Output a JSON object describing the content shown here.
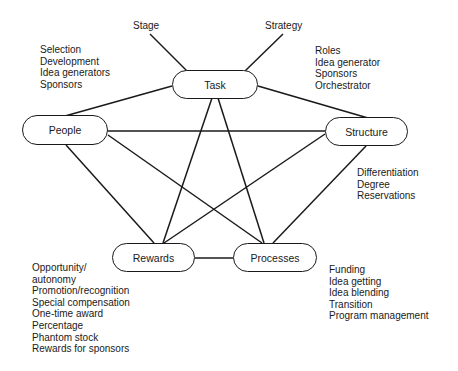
{
  "diagram": {
    "nodes": {
      "task": "Task",
      "people": "People",
      "structure": "Structure",
      "rewards": "Rewards",
      "processes": "Processes"
    },
    "external_labels": {
      "stage": "Stage",
      "strategy": "Strategy"
    },
    "lists": {
      "people": [
        "Selection",
        "Development",
        "Idea generators",
        "Sponsors"
      ],
      "structure_roles": [
        "Roles",
        "Idea generator",
        "Sponsors",
        "Orchestrator"
      ],
      "structure": [
        "Differentiation",
        "Degree",
        "Reservations"
      ],
      "rewards": [
        "Opportunity/",
        "autonomy",
        "Promotion/recognition",
        "Special compensation",
        "One-time award",
        "Percentage",
        "Phantom stock",
        "Rewards for sponsors"
      ],
      "processes": [
        "Funding",
        "Idea getting",
        "Idea blending",
        "Transition",
        "Program management"
      ]
    },
    "edges": [
      [
        "stage",
        "task"
      ],
      [
        "strategy",
        "task"
      ],
      [
        "task",
        "people"
      ],
      [
        "task",
        "structure"
      ],
      [
        "task",
        "rewards"
      ],
      [
        "task",
        "processes"
      ],
      [
        "people",
        "structure"
      ],
      [
        "people",
        "rewards"
      ],
      [
        "people",
        "processes"
      ],
      [
        "structure",
        "rewards"
      ],
      [
        "structure",
        "processes"
      ],
      [
        "rewards",
        "processes"
      ]
    ]
  }
}
